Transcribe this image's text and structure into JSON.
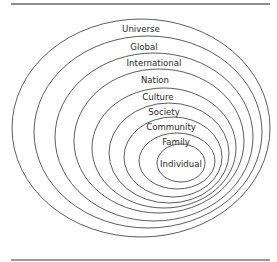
{
  "diagram": {
    "type": "nested-ellipses",
    "rule_color": "#8f8f8f",
    "stroke_color": "#4a4a4a",
    "levels": [
      {
        "label": "Universe",
        "cx": 141,
        "cy": 128,
        "rx": 129,
        "ry": 109,
        "label_x": 141,
        "label_y": 32
      },
      {
        "label": "Global",
        "cx": 148,
        "cy": 132,
        "rx": 114,
        "ry": 96,
        "label_x": 144,
        "label_y": 50
      },
      {
        "label": "International",
        "cx": 154,
        "cy": 137,
        "rx": 99,
        "ry": 84,
        "label_x": 154,
        "label_y": 66
      },
      {
        "label": "Nation",
        "cx": 159,
        "cy": 141,
        "rx": 85,
        "ry": 72,
        "label_x": 155,
        "label_y": 83
      },
      {
        "label": "Culture",
        "cx": 164,
        "cy": 148,
        "rx": 72,
        "ry": 60,
        "label_x": 158,
        "label_y": 100
      },
      {
        "label": "Society",
        "cx": 169,
        "cy": 153,
        "rx": 60,
        "ry": 50,
        "label_x": 164,
        "label_y": 115
      },
      {
        "label": "Community",
        "cx": 173,
        "cy": 157,
        "rx": 49,
        "ry": 40,
        "label_x": 171,
        "label_y": 130
      },
      {
        "label": "Family",
        "cx": 177,
        "cy": 161,
        "rx": 38,
        "ry": 28,
        "label_x": 176,
        "label_y": 145
      },
      {
        "label": "Individual",
        "cx": 181,
        "cy": 163,
        "rx": 24,
        "ry": 19,
        "label_x": 181,
        "label_y": 167
      }
    ]
  }
}
